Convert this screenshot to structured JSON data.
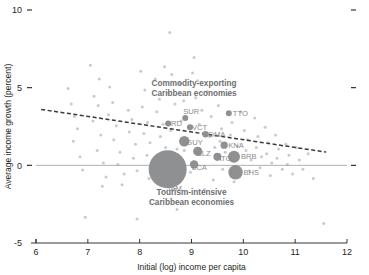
{
  "chart_data": {
    "type": "scatter",
    "title": "",
    "xlabel": "Initial (log) income per capita",
    "ylabel": "Average income growth (percent)",
    "xlim": [
      6,
      12
    ],
    "ylim": [
      -5,
      10
    ],
    "xticks": [
      "6",
      "7",
      "8",
      "9",
      "10",
      "11",
      "12"
    ],
    "yticks": [
      "10",
      "5",
      "0",
      "-5"
    ],
    "grid": false,
    "legend": "none",
    "annotations": [
      {
        "name": "commodity-exporting-label",
        "line1": "Commodity-exporting",
        "line2": "Caribbean economies",
        "x": 9.05,
        "y": 5.1
      },
      {
        "name": "tourism-intensive-label",
        "line1": "Tourism-intensive",
        "line2": "Caribbean economies",
        "x": 9.0,
        "y": -1.9
      }
    ],
    "trendline": {
      "style": "dashed",
      "x0": 6.1,
      "y0": 3.6,
      "x1": 11.6,
      "y1": 0.85
    },
    "zero_line": {
      "y": 0,
      "style": "solid"
    },
    "caribbean_points": [
      {
        "code": "TTO",
        "x": 9.72,
        "y": 3.35,
        "size": 3.0,
        "label_dx": 4,
        "label_dy": 2.5
      },
      {
        "code": "SUR",
        "x": 8.88,
        "y": 3.05,
        "size": 3.0,
        "label_dx": -2,
        "label_dy": -3.5
      },
      {
        "code": "GRD",
        "x": 8.55,
        "y": 2.7,
        "size": 3.0,
        "label_dx": -3,
        "label_dy": 3.0
      },
      {
        "code": "VCT",
        "x": 8.97,
        "y": 2.45,
        "size": 3.0,
        "label_dx": 2,
        "label_dy": 2.5
      },
      {
        "code": "DMA",
        "x": 9.27,
        "y": 2.0,
        "size": 3.2,
        "label_dx": 3,
        "label_dy": 2.5
      },
      {
        "code": "GUY",
        "x": 8.86,
        "y": 1.55,
        "size": 5.2,
        "label_dx": 2,
        "label_dy": 4.0
      },
      {
        "code": "KNA",
        "x": 9.63,
        "y": 1.3,
        "size": 3.6,
        "label_dx": 4,
        "label_dy": 2.5
      },
      {
        "code": "BLZ",
        "x": 9.12,
        "y": 0.9,
        "size": 4.6,
        "label_dx": -1,
        "label_dy": 4.2
      },
      {
        "code": "ATG",
        "x": 9.5,
        "y": 0.55,
        "size": 4.0,
        "label_dx": -1,
        "label_dy": 4.4
      },
      {
        "code": "BRB",
        "x": 9.82,
        "y": 0.55,
        "size": 6.0,
        "label_dx": 7,
        "label_dy": 2.5
      },
      {
        "code": "LCA",
        "x": 9.05,
        "y": 0.05,
        "size": 4.2,
        "label_dx": -2,
        "label_dy": 5.0
      },
      {
        "code": "BHS",
        "x": 9.85,
        "y": -0.45,
        "size": 7.2,
        "label_dx": 8,
        "label_dy": 3.0
      },
      {
        "code": "JAM",
        "x": 8.54,
        "y": -0.25,
        "size": 19.0,
        "label_dx": -1,
        "label_dy": 22.0
      }
    ],
    "background_points": [
      {
        "x": 6.62,
        "y": 4.95
      },
      {
        "x": 6.74,
        "y": 3.15
      },
      {
        "x": 6.8,
        "y": 2.35
      },
      {
        "x": 6.72,
        "y": 1.55
      },
      {
        "x": 6.85,
        "y": 0.55
      },
      {
        "x": 6.9,
        "y": -0.3
      },
      {
        "x": 6.95,
        "y": -3.35
      },
      {
        "x": 7.05,
        "y": 6.45
      },
      {
        "x": 7.12,
        "y": 4.45
      },
      {
        "x": 7.2,
        "y": 3.85
      },
      {
        "x": 7.1,
        "y": 2.85
      },
      {
        "x": 7.25,
        "y": 1.95
      },
      {
        "x": 7.18,
        "y": 0.95
      },
      {
        "x": 7.3,
        "y": 0.15
      },
      {
        "x": 7.35,
        "y": -0.75
      },
      {
        "x": 7.28,
        "y": -1.35
      },
      {
        "x": 7.42,
        "y": 5.05
      },
      {
        "x": 7.48,
        "y": 4.05
      },
      {
        "x": 7.4,
        "y": 3.25
      },
      {
        "x": 7.55,
        "y": 2.55
      },
      {
        "x": 7.5,
        "y": 1.65
      },
      {
        "x": 7.62,
        "y": 0.85
      },
      {
        "x": 7.58,
        "y": 0.05
      },
      {
        "x": 7.7,
        "y": -0.55
      },
      {
        "x": 7.66,
        "y": -1.25
      },
      {
        "x": 7.78,
        "y": 3.55
      },
      {
        "x": 7.85,
        "y": 2.95
      },
      {
        "x": 7.8,
        "y": 2.15
      },
      {
        "x": 7.92,
        "y": 1.35
      },
      {
        "x": 7.88,
        "y": 0.45
      },
      {
        "x": 7.95,
        "y": -0.35
      },
      {
        "x": 8.02,
        "y": 6.05
      },
      {
        "x": 8.1,
        "y": 4.85
      },
      {
        "x": 8.05,
        "y": 3.75
      },
      {
        "x": 8.15,
        "y": 2.75
      },
      {
        "x": 8.08,
        "y": 2.05
      },
      {
        "x": 8.2,
        "y": 1.45
      },
      {
        "x": 8.14,
        "y": 0.65
      },
      {
        "x": 8.25,
        "y": -0.15
      },
      {
        "x": 8.18,
        "y": -0.85
      },
      {
        "x": 8.3,
        "y": 5.55
      },
      {
        "x": 8.38,
        "y": 4.25
      },
      {
        "x": 8.33,
        "y": 3.45
      },
      {
        "x": 8.45,
        "y": 2.65
      },
      {
        "x": 8.4,
        "y": 1.85
      },
      {
        "x": 8.5,
        "y": 1.15
      },
      {
        "x": 8.44,
        "y": 0.35
      },
      {
        "x": 8.58,
        "y": 8.55
      },
      {
        "x": 8.62,
        "y": 5.85
      },
      {
        "x": 8.55,
        "y": 4.65
      },
      {
        "x": 8.68,
        "y": 3.95
      },
      {
        "x": 8.6,
        "y": 2.25
      },
      {
        "x": 8.72,
        "y": 1.05
      },
      {
        "x": 8.65,
        "y": 0.25
      },
      {
        "x": 8.78,
        "y": 5.25
      },
      {
        "x": 8.85,
        "y": 4.15
      },
      {
        "x": 8.8,
        "y": 2.85
      },
      {
        "x": 8.92,
        "y": 1.75
      },
      {
        "x": 8.86,
        "y": 0.95
      },
      {
        "x": 8.98,
        "y": -0.45
      },
      {
        "x": 9.05,
        "y": 6.95
      },
      {
        "x": 9.12,
        "y": 5.45
      },
      {
        "x": 9.08,
        "y": 4.35
      },
      {
        "x": 9.2,
        "y": 3.55
      },
      {
        "x": 9.15,
        "y": 2.65
      },
      {
        "x": 9.25,
        "y": -1.55
      },
      {
        "x": 9.3,
        "y": 4.75
      },
      {
        "x": 9.38,
        "y": 3.15
      },
      {
        "x": 9.35,
        "y": 1.85
      },
      {
        "x": 9.45,
        "y": 1.15
      },
      {
        "x": 9.42,
        "y": -0.95
      },
      {
        "x": 9.52,
        "y": 3.85
      },
      {
        "x": 9.58,
        "y": 2.35
      },
      {
        "x": 9.55,
        "y": 1.55
      },
      {
        "x": 9.65,
        "y": 0.85
      },
      {
        "x": 9.6,
        "y": -0.25
      },
      {
        "x": 9.7,
        "y": 4.55
      },
      {
        "x": 9.78,
        "y": 2.75
      },
      {
        "x": 9.75,
        "y": 1.95
      },
      {
        "x": 9.88,
        "y": 1.25
      },
      {
        "x": 9.82,
        "y": -1.05
      },
      {
        "x": 9.95,
        "y": 3.45
      },
      {
        "x": 10.02,
        "y": 2.25
      },
      {
        "x": 10.08,
        "y": 1.65
      },
      {
        "x": 10.05,
        "y": 0.95
      },
      {
        "x": 10.15,
        "y": 0.35
      },
      {
        "x": 10.12,
        "y": -0.35
      },
      {
        "x": 10.22,
        "y": 3.05
      },
      {
        "x": 10.28,
        "y": 1.85
      },
      {
        "x": 10.25,
        "y": 1.15
      },
      {
        "x": 10.35,
        "y": 0.55
      },
      {
        "x": 10.32,
        "y": -0.15
      },
      {
        "x": 10.42,
        "y": 2.45
      },
      {
        "x": 10.48,
        "y": 1.45
      },
      {
        "x": 10.45,
        "y": 0.75
      },
      {
        "x": 10.55,
        "y": 0.15
      },
      {
        "x": 10.52,
        "y": -0.65
      },
      {
        "x": 10.62,
        "y": 1.95
      },
      {
        "x": 10.68,
        "y": 1.05
      },
      {
        "x": 10.65,
        "y": 0.45
      },
      {
        "x": 10.75,
        "y": -0.25
      },
      {
        "x": 10.82,
        "y": 1.35
      },
      {
        "x": 10.88,
        "y": 0.65
      },
      {
        "x": 10.85,
        "y": 0.05
      },
      {
        "x": 10.95,
        "y": -0.55
      },
      {
        "x": 11.02,
        "y": 1.15
      },
      {
        "x": 11.08,
        "y": 0.35
      },
      {
        "x": 11.15,
        "y": -0.25
      },
      {
        "x": 11.25,
        "y": 0.75
      },
      {
        "x": 11.35,
        "y": -0.85
      },
      {
        "x": 11.55,
        "y": -3.75
      },
      {
        "x": 7.95,
        "y": -3.45
      },
      {
        "x": 8.72,
        "y": -2.85
      },
      {
        "x": 6.68,
        "y": 3.95
      },
      {
        "x": 7.22,
        "y": 5.55
      },
      {
        "x": 8.48,
        "y": 6.35
      },
      {
        "x": 9.02,
        "y": 5.95
      }
    ]
  }
}
